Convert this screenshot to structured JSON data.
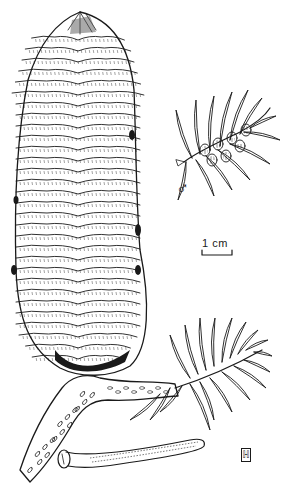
{
  "illustration": {
    "subject": "Fir cone with branchlet, male cones and needle",
    "colors": {
      "ink": "#1a1a1a",
      "paper": "#ffffff"
    },
    "parts": [
      "female-cone",
      "cone-branch",
      "male-cone-branchlet",
      "scale-bar",
      "needle-detail",
      "artist-monogram"
    ]
  },
  "labels": {
    "male_symbol": "♂",
    "scale_bar": "1 cm",
    "monogram": "ℍ"
  }
}
